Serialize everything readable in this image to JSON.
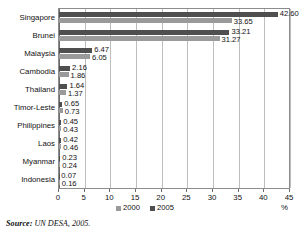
{
  "chart_data": {
    "type": "bar",
    "orientation": "horizontal",
    "title": "",
    "xlabel": "%",
    "ylabel": "",
    "xlim": [
      0,
      45
    ],
    "xticks": [
      0,
      5,
      10,
      15,
      20,
      25,
      30,
      35,
      40,
      45
    ],
    "grid": true,
    "legend_position": "bottom-center",
    "categories": [
      "Singapore",
      "Brunei",
      "Malaysia",
      "Cambodia",
      "Thailand",
      "Timor-Leste",
      "Philippines",
      "Laos",
      "Myanmar",
      "Indonesia"
    ],
    "series": [
      {
        "name": "2000",
        "color": "#9a9a9a",
        "values": [
          33.65,
          31.27,
          6.05,
          1.86,
          1.37,
          0.73,
          0.43,
          0.46,
          0.24,
          0.16
        ],
        "labels": [
          "33.65",
          "31.27",
          "6.05",
          "1.86",
          "1.37",
          "0.73",
          "0.43",
          "0.46",
          "0.24",
          "0.16"
        ]
      },
      {
        "name": "2005",
        "color": "#4f4f4f",
        "values": [
          42.6,
          33.21,
          6.47,
          2.16,
          1.64,
          0.65,
          0.45,
          0.42,
          0.23,
          0.07
        ],
        "labels": [
          "42.60",
          "33.21",
          "6.47",
          "2.16",
          "1.64",
          "0.65",
          "0.45",
          "0.42",
          "0.23",
          "0.07"
        ]
      }
    ]
  },
  "legend": {
    "items": [
      {
        "label": "2000"
      },
      {
        "label": "2005"
      }
    ]
  },
  "axis": {
    "x_unit": "%"
  },
  "source": {
    "label": "Source:",
    "text": " UN DESA, 2005."
  }
}
